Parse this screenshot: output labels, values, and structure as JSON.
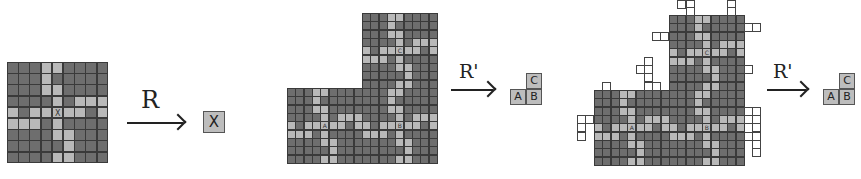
{
  "colors": {
    "dark_cell": "#6e6e6e",
    "light_cell": "#b9b9b9",
    "grid_line": "#3a3a3a",
    "result_box": "#bdbdbd",
    "protrusion_cell": "#ffffff"
  },
  "pattern": [
    "DDDLLDDDD",
    "DDDLDDDDD",
    "DDDLLDDDD",
    "DDDDLDLLL",
    "LDLLLLLDL",
    "LLLDLDDDD",
    "DDDDLLDDD",
    "DDDDDLDDD",
    "DDDDLLDDD"
  ],
  "center_label_cell": [
    4,
    4
  ],
  "figure1": {
    "block": {
      "x": 7,
      "y": 62,
      "cell": 11.2,
      "label": "X"
    },
    "arrow": {
      "x": 127,
      "y": 122,
      "w": 56,
      "label": "R",
      "label_x": 141,
      "label_y": 86,
      "label_size": 24
    },
    "result": [
      {
        "label": "X",
        "x": 203,
        "y": 111,
        "w": 22,
        "h": 22
      }
    ]
  },
  "figure2": {
    "cell": 8.35,
    "blocks": [
      {
        "label": "A",
        "x": 287,
        "y": 88
      },
      {
        "label": "B",
        "x": 362,
        "y": 88
      },
      {
        "label": "C",
        "x": 362,
        "y": 13
      }
    ],
    "arrow": {
      "x": 451,
      "y": 89,
      "w": 42,
      "label": "R'",
      "label_x": 459,
      "label_y": 60,
      "label_size": 19
    },
    "result": [
      {
        "label": "C",
        "x": 526,
        "y": 73,
        "w": 16,
        "h": 16
      },
      {
        "label": "A",
        "x": 510,
        "y": 89,
        "w": 16,
        "h": 16
      },
      {
        "label": "B",
        "x": 526,
        "y": 89,
        "w": 16,
        "h": 16
      }
    ]
  },
  "figure3": {
    "cell": 8.35,
    "blocks": [
      {
        "label": "A",
        "x": 594,
        "y": 90
      },
      {
        "label": "B",
        "x": 669,
        "y": 90
      },
      {
        "label": "C",
        "x": 669,
        "y": 15
      }
    ],
    "protrusions": [
      [
        677,
        0
      ],
      [
        686,
        0
      ],
      [
        686,
        7
      ],
      [
        727,
        0
      ],
      [
        727,
        7
      ],
      [
        744,
        23
      ],
      [
        752,
        23
      ],
      [
        652,
        32
      ],
      [
        660,
        32
      ],
      [
        744,
        65
      ],
      [
        644,
        57
      ],
      [
        636,
        65
      ],
      [
        644,
        65
      ],
      [
        644,
        73
      ],
      [
        644,
        82
      ],
      [
        652,
        82
      ],
      [
        602,
        82
      ],
      [
        577,
        115
      ],
      [
        585,
        115
      ],
      [
        577,
        123
      ],
      [
        577,
        132
      ],
      [
        744,
        107
      ],
      [
        752,
        107
      ],
      [
        744,
        115
      ],
      [
        752,
        115
      ],
      [
        752,
        123
      ],
      [
        744,
        132
      ],
      [
        752,
        132
      ],
      [
        752,
        140
      ],
      [
        752,
        148
      ]
    ],
    "arrow": {
      "x": 767,
      "y": 89,
      "w": 39,
      "label": "R'",
      "label_x": 773,
      "label_y": 60,
      "label_size": 19
    },
    "result": [
      {
        "label": "C",
        "x": 839,
        "y": 73,
        "w": 16,
        "h": 16
      },
      {
        "label": "A",
        "x": 823,
        "y": 89,
        "w": 16,
        "h": 16
      },
      {
        "label": "B",
        "x": 839,
        "y": 89,
        "w": 16,
        "h": 16
      }
    ]
  }
}
